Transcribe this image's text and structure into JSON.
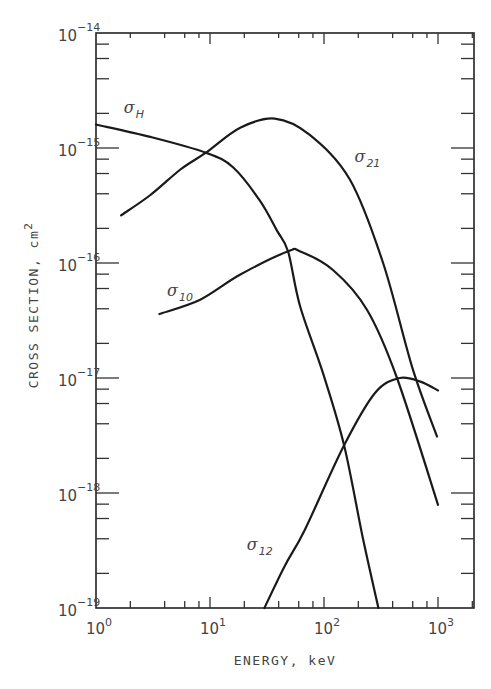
{
  "chart_data": {
    "type": "line",
    "title": "",
    "xlabel": "ENERGY, keV",
    "ylabel": "CROSS SECTION, cm²",
    "xscale": "log",
    "yscale": "log",
    "xlim": [
      1,
      2000
    ],
    "ylim": [
      1e-19,
      1e-14
    ],
    "grid": false,
    "legend": "inline labels on curves",
    "x_ticks": [
      {
        "value": 1,
        "base": "10",
        "exp": "0"
      },
      {
        "value": 10,
        "base": "10",
        "exp": "1"
      },
      {
        "value": 100,
        "base": "10",
        "exp": "2"
      },
      {
        "value": 1000,
        "base": "10",
        "exp": "3"
      }
    ],
    "y_ticks": [
      {
        "value": 1e-14,
        "base": "10",
        "exp": "−14"
      },
      {
        "value": 1e-15,
        "base": "10",
        "exp": "−15"
      },
      {
        "value": 1e-16,
        "base": "10",
        "exp": "−16"
      },
      {
        "value": 1e-17,
        "base": "10",
        "exp": "−17"
      },
      {
        "value": 1e-18,
        "base": "10",
        "exp": "−18"
      },
      {
        "value": 1e-19,
        "base": "10",
        "exp": "−19"
      }
    ],
    "minor_ticks_per_decade": [
      2,
      4,
      6,
      8
    ],
    "series": [
      {
        "name": "σ_H",
        "symbol": "σ",
        "subscript": "H",
        "label_pos": {
          "x": 1.75,
          "y": 2e-15
        },
        "x": [
          1,
          3.0,
          9.2,
          15.9,
          27.3,
          38.8,
          48.4,
          61.7,
          98,
          150,
          220,
          300
        ],
        "y": [
          1.6e-15,
          1.25e-15,
          9.1e-16,
          6.8e-16,
          3.5e-16,
          1.9e-16,
          1.26e-16,
          4.2e-17,
          1.1e-17,
          2.6e-18,
          4e-19,
          1e-19
        ]
      },
      {
        "name": "σ_21",
        "symbol": "σ",
        "subscript": "21",
        "label_pos": {
          "x": 185,
          "y": 7.5e-16
        },
        "x": [
          1.66,
          3.0,
          5.5,
          9.2,
          18.4,
          37,
          75,
          169,
          330,
          600,
          980
        ],
        "y": [
          2.6e-16,
          3.9e-16,
          6.5e-16,
          9.1e-16,
          1.5e-15,
          1.8e-15,
          1.3e-15,
          5.3e-16,
          1e-16,
          1.2e-17,
          3.1e-18
        ]
      },
      {
        "name": "σ_10",
        "symbol": "σ",
        "subscript": "10",
        "label_pos": {
          "x": 4.2,
          "y": 5.2e-17
        },
        "x": [
          3.6,
          8.2,
          18.3,
          48,
          62,
          120,
          239,
          437,
          1000
        ],
        "y": [
          3.6e-17,
          4.8e-17,
          7.9e-17,
          1.26e-16,
          1.26e-16,
          8.7e-17,
          3.9e-17,
          1e-17,
          7.9e-19
        ]
      },
      {
        "name": "σ_12",
        "symbol": "σ",
        "subscript": "12",
        "label_pos": {
          "x": 21,
          "y": 3.2e-19
        },
        "x": [
          30,
          45,
          68,
          150,
          280,
          460,
          700,
          1000
        ],
        "y": [
          1e-19,
          2.3e-19,
          4.8e-19,
          2.6e-18,
          7.4e-18,
          1e-17,
          9.3e-18,
          7.8e-18
        ]
      }
    ]
  }
}
